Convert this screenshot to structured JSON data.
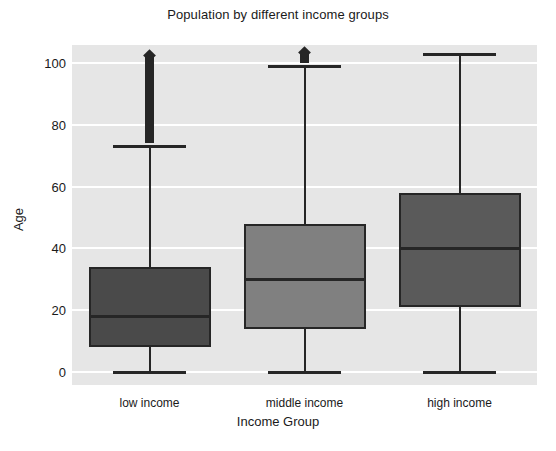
{
  "chart_data": {
    "type": "box",
    "title": "Population by different income groups",
    "xlabel": "Income Group",
    "ylabel": "Age",
    "categories": [
      "low income",
      "middle income",
      "high income"
    ],
    "ytick_labels": [
      "0",
      "20",
      "40",
      "60",
      "80",
      "100"
    ],
    "yticks": [
      0,
      20,
      40,
      60,
      80,
      100
    ],
    "ylim": [
      -8,
      110
    ],
    "grid": true,
    "legend": "none",
    "series": [
      {
        "name": "low income",
        "color": "#4a4a4a",
        "min": 0,
        "q1": 8,
        "median": 18,
        "q3": 34,
        "whisker_low": 0,
        "whisker_high": 73,
        "outliers_range": [
          74,
          104
        ],
        "outliers_note": "dense column of diamond outliers from 74 to 104"
      },
      {
        "name": "middle income",
        "color": "#808080",
        "min": 0,
        "q1": 14,
        "median": 30,
        "q3": 48,
        "whisker_low": 0,
        "whisker_high": 99,
        "outliers_range": [
          100,
          105
        ],
        "outliers_note": "short dense column of diamond outliers from 100 to 105"
      },
      {
        "name": "high income",
        "color": "#5a5a5a",
        "min": 0,
        "q1": 21,
        "median": 40,
        "q3": 58,
        "whisker_low": 0,
        "whisker_high": 103,
        "outliers_range": [],
        "outliers_note": "no outliers"
      }
    ],
    "style": {
      "plot_background": "#e6e6e6",
      "gridline_color": "#ffffff",
      "line_color": "#262626",
      "figure_background": "#ffffff"
    }
  }
}
